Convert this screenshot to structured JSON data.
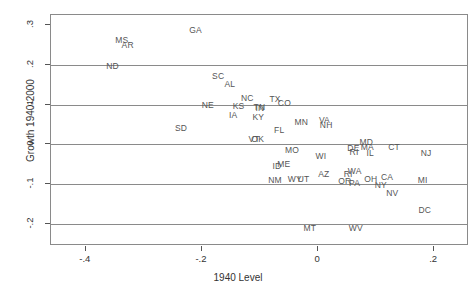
{
  "chart_data": {
    "type": "scatter",
    "title": "",
    "xlabel": "1940 Level",
    "ylabel": "Growth 1940-2000",
    "xlim": [
      -0.46,
      0.26
    ],
    "ylim": [
      -0.255,
      0.325
    ],
    "xticks": [
      -0.4,
      -0.2,
      0,
      0.2
    ],
    "xticklabels": [
      "-.4",
      "-.2",
      "0",
      ".2"
    ],
    "yticks": [
      0.3,
      0.2,
      0.1,
      0,
      -0.1,
      -0.2
    ],
    "yticklabels": [
      ".3",
      ".2",
      ".1",
      "0",
      "-.1",
      "-.2"
    ],
    "grid": true,
    "gridlines_y": [
      0.2,
      0.1,
      0.0,
      -0.1,
      -0.2
    ],
    "legend": "none",
    "marker_style": "text-label",
    "points": [
      {
        "label": "GA",
        "x": -0.211,
        "y": 0.288
      },
      {
        "label": "MS",
        "x": -0.338,
        "y": 0.262
      },
      {
        "label": "AR",
        "x": -0.328,
        "y": 0.25
      },
      {
        "label": "ND",
        "x": -0.354,
        "y": 0.197
      },
      {
        "label": "SC",
        "x": -0.172,
        "y": 0.172
      },
      {
        "label": "AL",
        "x": -0.152,
        "y": 0.151
      },
      {
        "label": "NC",
        "x": -0.122,
        "y": 0.117
      },
      {
        "label": "TX",
        "x": -0.074,
        "y": 0.113
      },
      {
        "label": "CO",
        "x": -0.058,
        "y": 0.105
      },
      {
        "label": "NE",
        "x": -0.19,
        "y": 0.098
      },
      {
        "label": "KS",
        "x": -0.137,
        "y": 0.096
      },
      {
        "label": "TN",
        "x": -0.101,
        "y": 0.093
      },
      {
        "label": "IN",
        "x": -0.1,
        "y": 0.092
      },
      {
        "label": "IA",
        "x": -0.146,
        "y": 0.073
      },
      {
        "label": "KY",
        "x": -0.103,
        "y": 0.069
      },
      {
        "label": "MN",
        "x": -0.029,
        "y": 0.056
      },
      {
        "label": "VA",
        "x": 0.011,
        "y": 0.062
      },
      {
        "label": "NH",
        "x": 0.014,
        "y": 0.048
      },
      {
        "label": "SD",
        "x": -0.236,
        "y": 0.042
      },
      {
        "label": "FL",
        "x": -0.067,
        "y": 0.036
      },
      {
        "label": "VT",
        "x": -0.11,
        "y": 0.013
      },
      {
        "label": "OK",
        "x": -0.104,
        "y": 0.013
      },
      {
        "label": "MO",
        "x": -0.045,
        "y": -0.014
      },
      {
        "label": "MD",
        "x": 0.083,
        "y": 0.005
      },
      {
        "label": "MA",
        "x": 0.085,
        "y": -0.006
      },
      {
        "label": "DE",
        "x": 0.061,
        "y": -0.01
      },
      {
        "label": "RI",
        "x": 0.062,
        "y": -0.018
      },
      {
        "label": "IL",
        "x": 0.09,
        "y": -0.022
      },
      {
        "label": "CT",
        "x": 0.131,
        "y": -0.007
      },
      {
        "label": "NJ",
        "x": 0.186,
        "y": -0.022
      },
      {
        "label": "WI",
        "x": 0.005,
        "y": -0.028
      },
      {
        "label": "ID",
        "x": -0.071,
        "y": -0.055
      },
      {
        "label": "ME",
        "x": -0.059,
        "y": -0.049
      },
      {
        "label": "AZ",
        "x": 0.01,
        "y": -0.073
      },
      {
        "label": "RI2",
        "x": 0.052,
        "y": -0.073
      },
      {
        "label": "WA",
        "x": 0.063,
        "y": -0.067
      },
      {
        "label": "NM",
        "x": -0.074,
        "y": -0.09
      },
      {
        "label": "WY",
        "x": -0.04,
        "y": -0.088
      },
      {
        "label": "UT",
        "x": -0.025,
        "y": -0.088
      },
      {
        "label": "OR",
        "x": 0.046,
        "y": -0.092
      },
      {
        "label": "PA",
        "x": 0.063,
        "y": -0.098
      },
      {
        "label": "OH",
        "x": 0.091,
        "y": -0.087
      },
      {
        "label": "CA",
        "x": 0.119,
        "y": -0.081
      },
      {
        "label": "NY",
        "x": 0.108,
        "y": -0.101
      },
      {
        "label": "MI",
        "x": 0.18,
        "y": -0.09
      },
      {
        "label": "NV",
        "x": 0.128,
        "y": -0.123
      },
      {
        "label": "DC",
        "x": 0.184,
        "y": -0.164
      },
      {
        "label": "MT",
        "x": -0.014,
        "y": -0.21
      },
      {
        "label": "WV",
        "x": 0.065,
        "y": -0.21
      }
    ]
  },
  "axes": {
    "x_title": "1940 Level",
    "y_title": "Growth 1940-2000"
  }
}
